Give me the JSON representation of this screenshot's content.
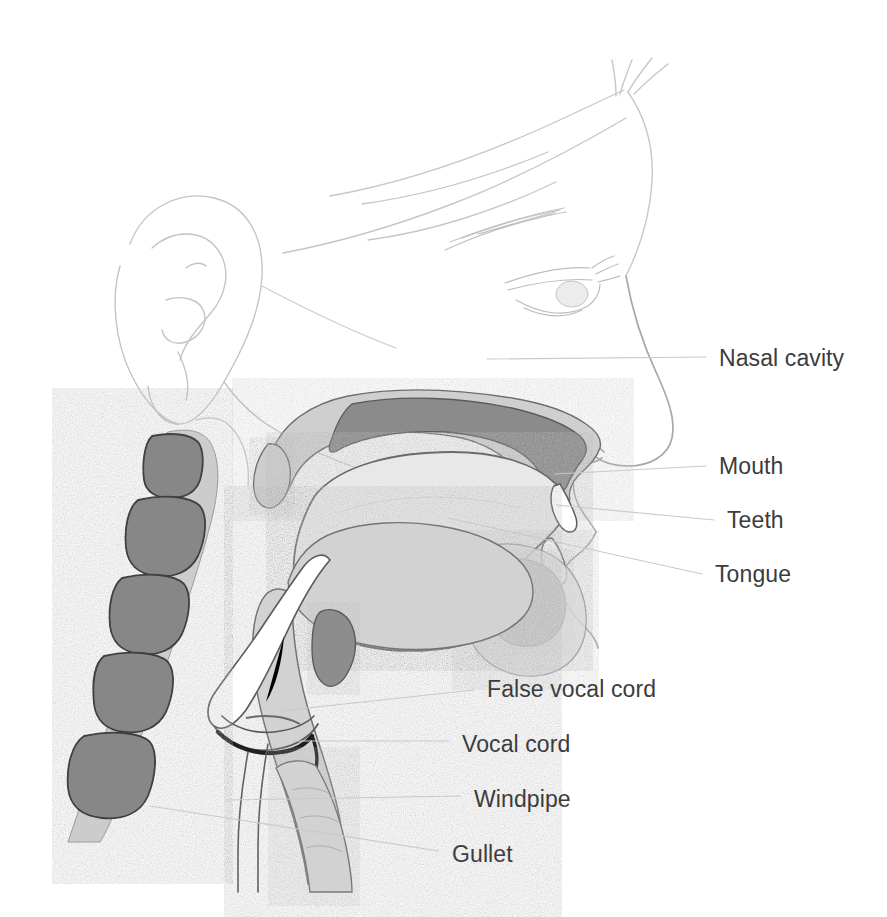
{
  "figure": {
    "style": "pencil-and-wash anatomical illustration",
    "background_color": "#ffffff"
  },
  "palette": {
    "text": "#3c3c3c",
    "leader_line": "#c9c9c9",
    "faint_outline": "#c8c8c8",
    "soft_tissue_light": "#e3e3e3",
    "tongue_fill": "#e9e9e9",
    "mid_gray": "#b4b4b4",
    "dark_gray": "#8f8f8f",
    "vertebra_fill": "#8a8a8a",
    "outline_dark": "#4a4a4a",
    "white": "#ffffff"
  },
  "labels": [
    {
      "id": "nasal-cavity",
      "text": "Nasal cavity",
      "x": 719,
      "y": 347,
      "leader": {
        "x1": 487,
        "y1": 359,
        "x2": 706,
        "y2": 357
      }
    },
    {
      "id": "mouth",
      "text": "Mouth",
      "x": 719,
      "y": 455,
      "leader": {
        "x1": 555,
        "y1": 474,
        "x2": 706,
        "y2": 466
      }
    },
    {
      "id": "teeth",
      "text": "Teeth",
      "x": 727,
      "y": 509,
      "leader": {
        "x1": 556,
        "y1": 505,
        "x2": 714,
        "y2": 520
      }
    },
    {
      "id": "tongue",
      "text": "Tongue",
      "x": 715,
      "y": 563,
      "leader": {
        "x1": 448,
        "y1": 518,
        "x2": 702,
        "y2": 574
      }
    },
    {
      "id": "false-vocal-cord",
      "text": "False vocal cord",
      "x": 487,
      "y": 678,
      "leader": {
        "x1": 279,
        "y1": 711,
        "x2": 474,
        "y2": 690
      }
    },
    {
      "id": "vocal-cord",
      "text": "Vocal cord",
      "x": 462,
      "y": 733,
      "leader": {
        "x1": 293,
        "y1": 741,
        "x2": 449,
        "y2": 741
      }
    },
    {
      "id": "windpipe",
      "text": "Windpipe",
      "x": 474,
      "y": 788,
      "leader": {
        "x1": 227,
        "y1": 800,
        "x2": 461,
        "y2": 796
      }
    },
    {
      "id": "gullet",
      "text": "Gullet",
      "x": 452,
      "y": 843,
      "leader": {
        "x1": 150,
        "y1": 806,
        "x2": 439,
        "y2": 851
      }
    }
  ],
  "anatomy_parts": [
    "head-profile-outline",
    "ear",
    "eye",
    "eyebrow",
    "nose",
    "lips",
    "hard-and-soft-palate",
    "uvula",
    "nasal-cavity-space",
    "tongue",
    "teeth-upper",
    "teeth-lower",
    "epiglottis",
    "hyoid-cartilage",
    "pharynx-wall",
    "false-vocal-cord",
    "vocal-cord",
    "larynx",
    "windpipe-trachea",
    "gullet-esophagus",
    "cervical-vertebrae",
    "spinal-tissue"
  ],
  "vertebrae_count": 5
}
